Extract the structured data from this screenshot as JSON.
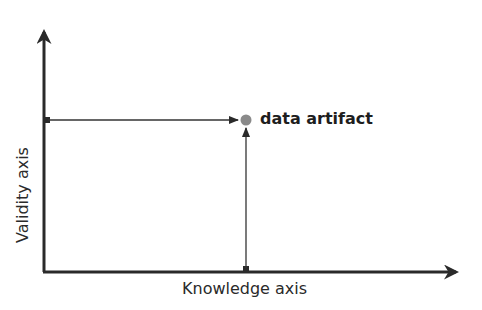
{
  "diagram": {
    "x_axis_label": "Knowledge axis",
    "y_axis_label": "Validity axis",
    "point_label": "data artifact",
    "colors": {
      "axis": "#2a2a2a",
      "guide_line": "#333333",
      "point": "#8a8a8a",
      "background": "#ffffff"
    }
  }
}
